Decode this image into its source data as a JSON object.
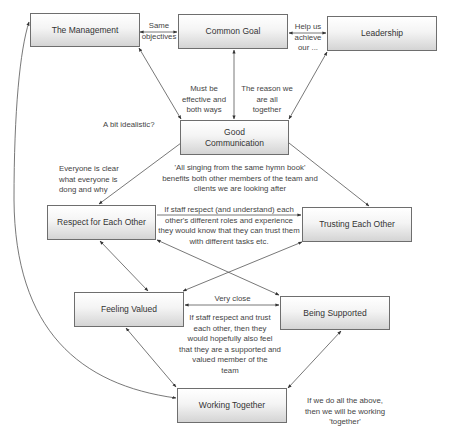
{
  "nodes": {
    "management": "The Management",
    "common_goal": "Common Goal",
    "leadership": "Leadership",
    "good_communication": "Good\nCommunication",
    "respect": "Respect for Each Other",
    "trusting": "Trusting Each Other",
    "feeling_valued": "Feeling Valued",
    "being_supported": "Being Supported",
    "working_together": "Working Together"
  },
  "labels": {
    "same_objectives": "Same\nobjectives",
    "help_us_achieve": "Help us\nachieve\nour ...",
    "must_be_effective": "Must be\neffective and\nboth ways",
    "reason_together": "The reason we\nare all\ntogether",
    "idealistic": "A bit idealistic?",
    "everyone_clear": "Everyone is clear\nwhat everyone is\ndong and why",
    "hymn_book": "'All singing from the same hymn book'\nbenefits both other members of the team and\nclients we are looking after",
    "staff_respect_understand": "If staff respect (and understand) each\nother's different roles and experience\nthey would know that they can trust them\nwith different tasks etc.",
    "very_close": "Very close",
    "staff_respect_trust": "If staff respect and trust\neach other, then they\nwould hopefully also feel\nthat they are a supported and\nvalued member of the\nteam",
    "do_all_above": "If we do all the above,\nthen we will be working\n'together'"
  },
  "colors": {
    "box_border": "#6e6e6e",
    "box_top": "#ffffff",
    "box_bottom": "#d4d4d4",
    "line": "#444444",
    "text": "#333333"
  }
}
